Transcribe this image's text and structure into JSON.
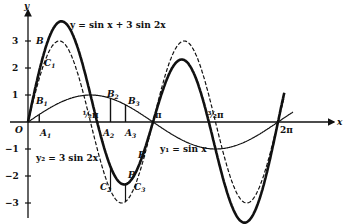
{
  "diagram": {
    "axes": {
      "x_label": "x",
      "y_label": "y",
      "origin_label": "O",
      "y_ticks": [
        {
          "v": 3,
          "label": "3"
        },
        {
          "v": 2,
          "label": "2"
        },
        {
          "v": 1,
          "label": "1"
        },
        {
          "v": -1,
          "label": "−1"
        },
        {
          "v": -2,
          "label": "−2"
        },
        {
          "v": -3,
          "label": "−3"
        }
      ],
      "x_ticks": [
        {
          "v": 0.5,
          "label": "½π"
        },
        {
          "v": 1,
          "label": "π"
        },
        {
          "v": 1.5,
          "label": "³⁄₂π"
        },
        {
          "v": 2,
          "label": "2π"
        }
      ]
    },
    "curves": [
      {
        "name": "sum-curve",
        "label": "y = sin x + 3 sin 2x",
        "a": 1,
        "b": 3,
        "style": "thick"
      },
      {
        "name": "y2-curve",
        "label": "y₂ = 3 sin 2x",
        "a": 0,
        "b": 3,
        "style": "dashed"
      },
      {
        "name": "y1-curve",
        "label": "y₁ = sin x",
        "a": 1,
        "b": 0,
        "style": "thin"
      }
    ],
    "points": [
      {
        "label": "A",
        "sub": "1"
      },
      {
        "label": "A",
        "sub": "2"
      },
      {
        "label": "A",
        "sub": "3"
      },
      {
        "label": "B",
        "sub": "1"
      },
      {
        "label": "B",
        "sub": "2"
      },
      {
        "label": "B",
        "sub": "3"
      },
      {
        "label": "B",
        "sub": ""
      },
      {
        "label": "B",
        "sub": ""
      },
      {
        "label": "B",
        "sub": ""
      },
      {
        "label": "C",
        "sub": "1"
      },
      {
        "label": "C",
        "sub": "2"
      },
      {
        "label": "C",
        "sub": "3"
      }
    ]
  }
}
